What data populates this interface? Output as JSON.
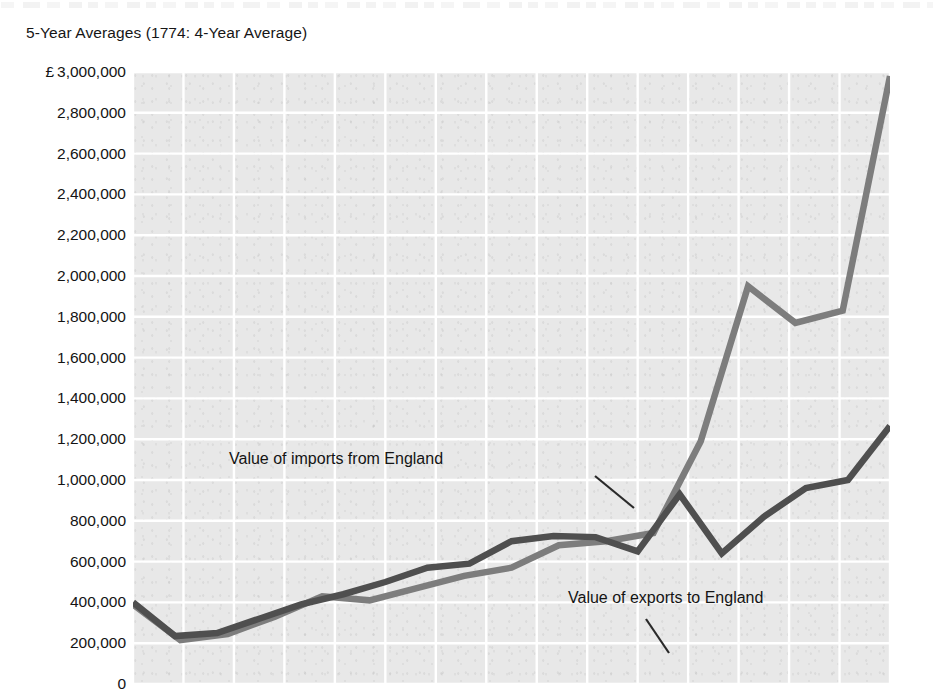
{
  "page": {
    "subtitle": "5-Year Averages (1774: 4-Year Average)",
    "background_color": "#ffffff",
    "plot_background_color": "#e8e8e8",
    "gridline_color": "#ffffff"
  },
  "annotations": {
    "imports_label": "Value of imports from England",
    "exports_label": "Value of exports to England"
  },
  "chart_data": {
    "type": "line",
    "title": "",
    "subtitle": "5-Year Averages (1774: 4-Year Average)",
    "xlabel": "",
    "ylabel": "",
    "ylim": [
      0,
      3000000
    ],
    "y_tick_prefix": "£",
    "y_tick_labels": [
      "£ 3,000,000",
      "2,800,000",
      "2,600,000",
      "2,400,000",
      "2,200,000",
      "2,000,000",
      "1,800,000",
      "1,600,000",
      "1,400,000",
      "1,200,000",
      "1,000,000",
      "800,000",
      "600,000",
      "400,000",
      "200,000",
      "0"
    ],
    "y_ticks": [
      3000000,
      2800000,
      2600000,
      2400000,
      2200000,
      2000000,
      1800000,
      1600000,
      1400000,
      1200000,
      1000000,
      800000,
      600000,
      400000,
      200000,
      0
    ],
    "grid": true,
    "grid_x_divisions": 15,
    "legend": "inline-annotations",
    "x_index": [
      0,
      1,
      2,
      3,
      4,
      5,
      6,
      7,
      8,
      9,
      10,
      11,
      12,
      13,
      14,
      15
    ],
    "series": [
      {
        "name": "Value of imports from England",
        "color": "#7d7d7d",
        "values": [
          390000,
          215000,
          245000,
          330000,
          430000,
          410000,
          470000,
          530000,
          570000,
          680000,
          700000,
          740000,
          1190000,
          1950000,
          1770000,
          1830000,
          2980000
        ]
      },
      {
        "name": "Value of exports to England",
        "color": "#4f4f4f",
        "values": [
          400000,
          235000,
          250000,
          320000,
          390000,
          440000,
          500000,
          570000,
          590000,
          700000,
          725000,
          720000,
          650000,
          930000,
          640000,
          820000,
          960000,
          1000000,
          1265000
        ]
      }
    ]
  }
}
